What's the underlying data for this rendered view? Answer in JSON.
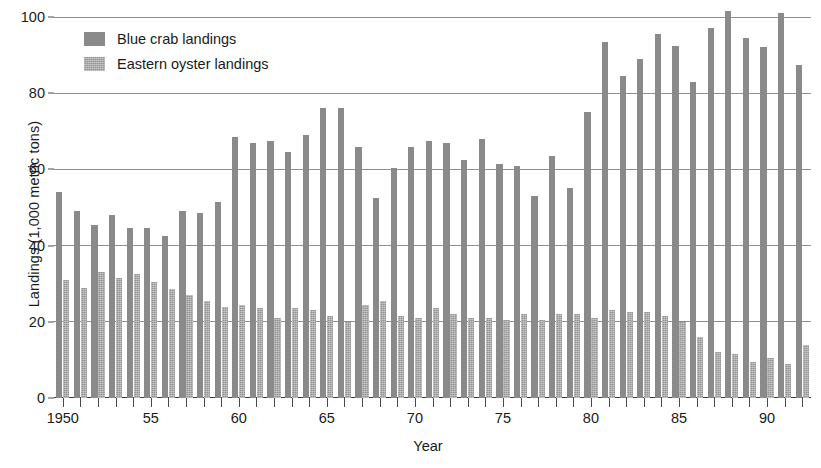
{
  "chart_data": {
    "type": "bar",
    "title": "",
    "xlabel": "Year",
    "ylabel": "Landings (1,000 metric tons)",
    "ylim": [
      0,
      100
    ],
    "yticks": [
      0,
      20,
      40,
      60,
      80,
      100
    ],
    "ytick_labels": [
      "0",
      "20",
      "40",
      "60",
      "80",
      "100"
    ],
    "grid": true,
    "legend_position": "top-left",
    "x": [
      1950,
      1951,
      1952,
      1953,
      1954,
      1955,
      1956,
      1957,
      1958,
      1959,
      1960,
      1961,
      1962,
      1963,
      1964,
      1965,
      1966,
      1967,
      1968,
      1969,
      1970,
      1971,
      1972,
      1973,
      1974,
      1975,
      1976,
      1977,
      1978,
      1979,
      1980,
      1981,
      1982,
      1983,
      1984,
      1985,
      1986,
      1987,
      1988,
      1989,
      1990,
      1991,
      1992
    ],
    "xtick_labels": [
      "1950",
      "55",
      "60",
      "65",
      "70",
      "75",
      "80",
      "85",
      "90"
    ],
    "xtick_label_years": [
      1950,
      1955,
      1960,
      1965,
      1970,
      1975,
      1980,
      1985,
      1990
    ],
    "series": [
      {
        "name": "Blue crab landings",
        "color": "#8a8a8a",
        "pattern": "solid",
        "values": [
          54.0,
          49.0,
          45.5,
          48.0,
          44.5,
          44.5,
          42.5,
          49.0,
          48.5,
          51.5,
          68.5,
          67.0,
          67.5,
          64.5,
          69.0,
          76.0,
          76.0,
          66.0,
          52.5,
          60.5,
          66.0,
          67.5,
          67.0,
          62.5,
          68.0,
          61.5,
          61.0,
          53.0,
          63.5,
          55.0,
          75.0,
          93.5,
          84.5,
          89.0,
          95.5,
          92.5,
          83.0,
          97.0,
          101.5,
          94.5,
          92.0,
          101.0,
          87.5
        ]
      },
      {
        "name": "Eastern oyster landings",
        "color": "#939393",
        "pattern": "stippled",
        "values": [
          31.0,
          29.0,
          33.0,
          31.5,
          32.5,
          30.5,
          28.5,
          27.0,
          25.5,
          24.0,
          24.5,
          23.5,
          21.0,
          23.5,
          23.0,
          21.5,
          20.0,
          24.5,
          25.5,
          21.5,
          21.0,
          23.5,
          22.0,
          21.0,
          21.0,
          20.5,
          22.0,
          20.5,
          22.0,
          22.0,
          21.0,
          23.0,
          22.5,
          22.5,
          21.5,
          20.0,
          16.0,
          12.0,
          11.5,
          9.5,
          10.5,
          9.0,
          14.0
        ]
      }
    ]
  },
  "legend": {
    "items": [
      {
        "label": "Blue crab landings",
        "swatch_class": "crab"
      },
      {
        "label": "Eastern oyster landings",
        "swatch_class": "oyster"
      }
    ]
  }
}
